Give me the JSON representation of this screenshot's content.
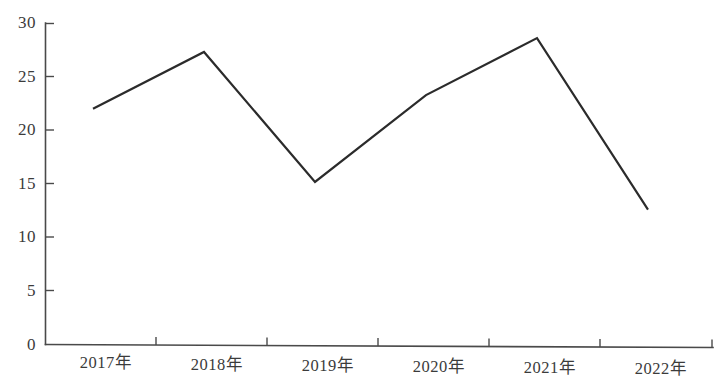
{
  "chart_data": {
    "type": "line",
    "title": "",
    "subtitle": "",
    "xlabel": "",
    "ylabel": "",
    "categories": [
      "2017年",
      "2018年",
      "2019年",
      "2020年",
      "2021年",
      "2022年"
    ],
    "values": [
      22.0,
      27.3,
      15.2,
      23.3,
      28.6,
      12.7
    ],
    "series": [
      {
        "name": "",
        "values": [
          22.0,
          27.3,
          15.2,
          23.3,
          28.6,
          12.7
        ]
      }
    ],
    "ylim": [
      0,
      30
    ],
    "yticks": [
      0,
      5,
      10,
      15,
      20,
      25,
      30
    ],
    "ytick_labels": [
      "0",
      "5",
      "10",
      "15",
      "20",
      "25",
      "30"
    ],
    "grid": false,
    "legend": false,
    "legend_position": "none",
    "line_color": "#2b2b2b",
    "axis_color": "#4a4a4a",
    "background_color": "#ffffff",
    "annotations": []
  }
}
